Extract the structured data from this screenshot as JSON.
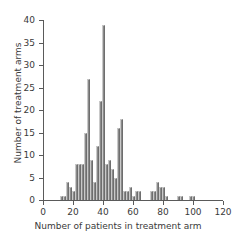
{
  "chart_data": {
    "type": "bar",
    "title": "",
    "subtitle": "",
    "xlabel": "Number of patients in treatment arm",
    "ylabel": "Number of treatment arms",
    "xlim": [
      0,
      120
    ],
    "ylim": [
      0,
      40
    ],
    "xticks": [
      0,
      20,
      40,
      60,
      80,
      100,
      120
    ],
    "yticks": [
      0,
      5,
      10,
      15,
      20,
      25,
      30,
      35,
      40
    ],
    "xtick_labels": [
      "0",
      "20",
      "40",
      "60",
      "80",
      "100",
      "120"
    ],
    "ytick_labels": [
      "0",
      "5",
      "10",
      "15",
      "20",
      "25",
      "30",
      "35",
      "40"
    ],
    "grid": false,
    "legend": null,
    "bin_width": 2,
    "bar_color": "#8a8a8a",
    "axis_color": "#5a5a5a",
    "background_color": "#ffffff",
    "categories": [
      12,
      14,
      16,
      18,
      20,
      22,
      24,
      26,
      28,
      30,
      32,
      34,
      36,
      38,
      40,
      42,
      44,
      46,
      48,
      50,
      52,
      54,
      56,
      58,
      60,
      62,
      64,
      66,
      68,
      70,
      72,
      74,
      76,
      78,
      80,
      82,
      84,
      86,
      88,
      90,
      92,
      94,
      96,
      98,
      100,
      102
    ],
    "values": [
      1,
      1,
      4,
      3,
      2,
      8,
      8,
      8,
      15,
      27,
      9,
      4,
      12,
      22,
      39,
      8,
      9,
      7,
      5,
      16,
      18,
      2,
      2,
      3,
      1,
      2,
      2,
      0,
      0,
      0,
      2,
      2,
      4,
      3,
      3,
      1,
      0,
      0,
      0,
      1,
      1,
      0,
      0,
      1,
      1,
      0
    ]
  }
}
